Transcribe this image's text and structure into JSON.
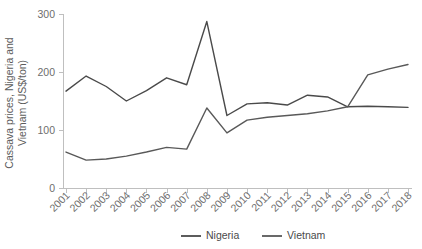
{
  "chart_data": {
    "type": "line",
    "title": "",
    "xlabel": "",
    "ylabel": "Cassava prices, Nigeria and Vietnam (US$/ton)",
    "ylabel_line1": "Cassava prices, Nigeria and",
    "ylabel_line2": "Vietnam (US$/ton)",
    "categories": [
      "2001",
      "2002",
      "2003",
      "2004",
      "2005",
      "2006",
      "2007",
      "2008",
      "2009",
      "2010",
      "2011",
      "2012",
      "2013",
      "2014",
      "2015",
      "2016",
      "2017",
      "2018"
    ],
    "x": [
      2001,
      2002,
      2003,
      2004,
      2005,
      2006,
      2007,
      2008,
      2009,
      2010,
      2011,
      2012,
      2013,
      2014,
      2015,
      2016,
      2017,
      2018
    ],
    "series": [
      {
        "name": "Nigeria",
        "color": "#4a4a4a",
        "values": [
          167,
          193,
          175,
          150,
          168,
          190,
          178,
          287,
          125,
          145,
          147,
          143,
          160,
          157,
          140,
          141,
          140,
          139
        ]
      },
      {
        "name": "Vietnam",
        "color": "#595959",
        "values": [
          62,
          48,
          50,
          55,
          62,
          70,
          67,
          138,
          95,
          117,
          122,
          125,
          128,
          133,
          140,
          195,
          205,
          213
        ]
      }
    ],
    "ylim": [
      0,
      300
    ],
    "yticks": [
      0,
      100,
      200,
      300
    ],
    "ytick_labels": [
      "0",
      "100",
      "200",
      "300"
    ],
    "grid": false,
    "legend_position": "bottom-center",
    "legend_entries": [
      "Nigeria",
      "Vietnam"
    ],
    "axis_color": "#bfbfbf",
    "tick_label_color": "#6e6e6e",
    "background": "#ffffff"
  }
}
